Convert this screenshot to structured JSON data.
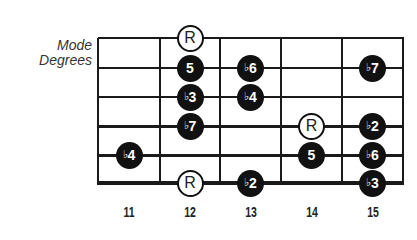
{
  "title": {
    "line1": "Mode",
    "line2": "Degrees"
  },
  "fretboard": {
    "fret_numbers": [
      "11",
      "12",
      "13",
      "14",
      "15"
    ],
    "strings": 6,
    "colors": {
      "line": "#1a1a1a",
      "dot_fill": "#111111",
      "root_fill": "#ffffff"
    }
  },
  "notes": [
    {
      "string": 1,
      "fret": "12",
      "label": "R",
      "flat": false,
      "type": "root"
    },
    {
      "string": 2,
      "fret": "12",
      "label": "5",
      "flat": false,
      "type": "filled"
    },
    {
      "string": 2,
      "fret": "13",
      "label": "6",
      "flat": true,
      "type": "filled"
    },
    {
      "string": 2,
      "fret": "15",
      "label": "7",
      "flat": true,
      "type": "filled"
    },
    {
      "string": 3,
      "fret": "12",
      "label": "3",
      "flat": true,
      "type": "filled"
    },
    {
      "string": 3,
      "fret": "13",
      "label": "4",
      "flat": true,
      "type": "filled"
    },
    {
      "string": 4,
      "fret": "12",
      "label": "7",
      "flat": true,
      "type": "filled"
    },
    {
      "string": 4,
      "fret": "14",
      "label": "R",
      "flat": false,
      "type": "root"
    },
    {
      "string": 4,
      "fret": "15",
      "label": "2",
      "flat": true,
      "type": "filled"
    },
    {
      "string": 5,
      "fret": "11",
      "label": "4",
      "flat": true,
      "type": "filled"
    },
    {
      "string": 5,
      "fret": "14",
      "label": "5",
      "flat": false,
      "type": "filled"
    },
    {
      "string": 5,
      "fret": "15",
      "label": "6",
      "flat": true,
      "type": "filled"
    },
    {
      "string": 6,
      "fret": "12",
      "label": "R",
      "flat": false,
      "type": "root"
    },
    {
      "string": 6,
      "fret": "13",
      "label": "2",
      "flat": true,
      "type": "filled"
    },
    {
      "string": 6,
      "fret": "15",
      "label": "3",
      "flat": true,
      "type": "filled"
    }
  ],
  "flat_symbol": "♭"
}
